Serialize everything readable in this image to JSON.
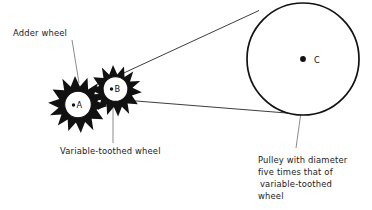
{
  "figure": {
    "background_color": "#ffffff",
    "ink_color": "#111111",
    "leader_color": "#5a5a5a"
  },
  "labels": {
    "adder_wheel": "Adder wheel",
    "variable_toothed_wheel": "Variable-toothed wheel",
    "pulley_caption_line1": "Pulley with diameter",
    "pulley_caption_line2": "five times that of",
    "pulley_caption_line3": "variable-toothed",
    "pulley_caption_line4": "wheel"
  },
  "points": {
    "a": "A",
    "b": "B",
    "c": "C"
  },
  "components": {
    "adder_wheel": {
      "name": "adder-wheel",
      "center_x": 75,
      "center_y": 99,
      "hub_radius": 13.5,
      "tooth_tip_radius": 23,
      "tooth_count": 12,
      "point_label": "A"
    },
    "variable_toothed_wheel": {
      "name": "variable-toothed-wheel",
      "center_x": 113,
      "center_y": 88,
      "hub_radius": 12.5,
      "tooth_tip_radius": 21,
      "tooth_count": 12,
      "point_label": "B"
    },
    "pulley": {
      "name": "pulley",
      "center_x": 303,
      "center_y": 59,
      "radius": 56,
      "point_label": "C"
    },
    "belt": {
      "name": "drive-belt",
      "upper_strand": [
        121,
        73,
        258,
        11
      ],
      "lower_strand": [
        118,
        99,
        291,
        114
      ]
    }
  }
}
